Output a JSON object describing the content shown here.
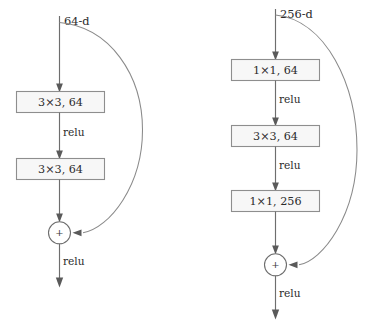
{
  "figure": {
    "name": "resnet-residual-blocks",
    "background_color": "#ffffff",
    "box_fill_color": "#f7f7f7",
    "box_border_color": "#8e8e8e",
    "line_color": "#6e6e6e",
    "curve_color": "#8a8a8a",
    "text_color": "#2b2b2b"
  },
  "diagrams": [
    {
      "id": "basic-block",
      "input_label": "64-d",
      "sum_glyph": "+",
      "output_label": "relu",
      "blocks": [
        {
          "label": "3×3, 64"
        },
        {
          "label": "3×3, 64"
        }
      ],
      "activations": [
        {
          "label": "relu"
        }
      ]
    },
    {
      "id": "bottleneck-block",
      "input_label": "256-d",
      "sum_glyph": "+",
      "output_label": "relu",
      "blocks": [
        {
          "label": "1×1, 64"
        },
        {
          "label": "3×3, 64"
        },
        {
          "label": "1×1, 256"
        }
      ],
      "activations": [
        {
          "label": "relu"
        },
        {
          "label": "relu"
        }
      ]
    }
  ]
}
